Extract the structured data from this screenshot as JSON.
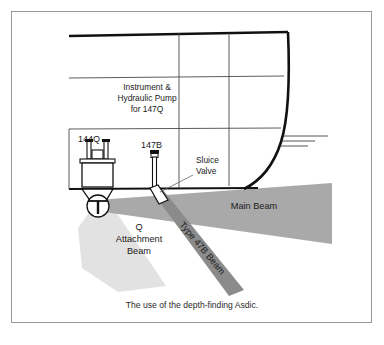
{
  "figure": {
    "caption": "The use of the depth-finding Asdic.",
    "background_color": "#ffffff",
    "frame_color": "#9a9a9a",
    "line_color": "#111111"
  },
  "labels": {
    "instrument_line1": "Instrument &",
    "instrument_line2": "Hydraulic Pump",
    "instrument_line3": "for 147Q",
    "dome_unit": "144Q",
    "shaft_unit": "147B",
    "sluice_line1": "Sluice",
    "sluice_line2": "Valve"
  },
  "beams": [
    {
      "id": "main-beam",
      "label": "Main Beam",
      "color": "#a9a9a9",
      "orientation": "horizontal-right"
    },
    {
      "id": "q-attachment-beam",
      "label_line1": "Q",
      "label_line2": "Attachment",
      "label_line3": "Beam",
      "color": "#e2e2e2",
      "orientation": "downward-fan"
    },
    {
      "id": "type-47b-beam",
      "label": "Type 47B Beam",
      "color": "#8b8b8b",
      "orientation": "diagonal-down-right",
      "rotation_deg": 50
    }
  ]
}
